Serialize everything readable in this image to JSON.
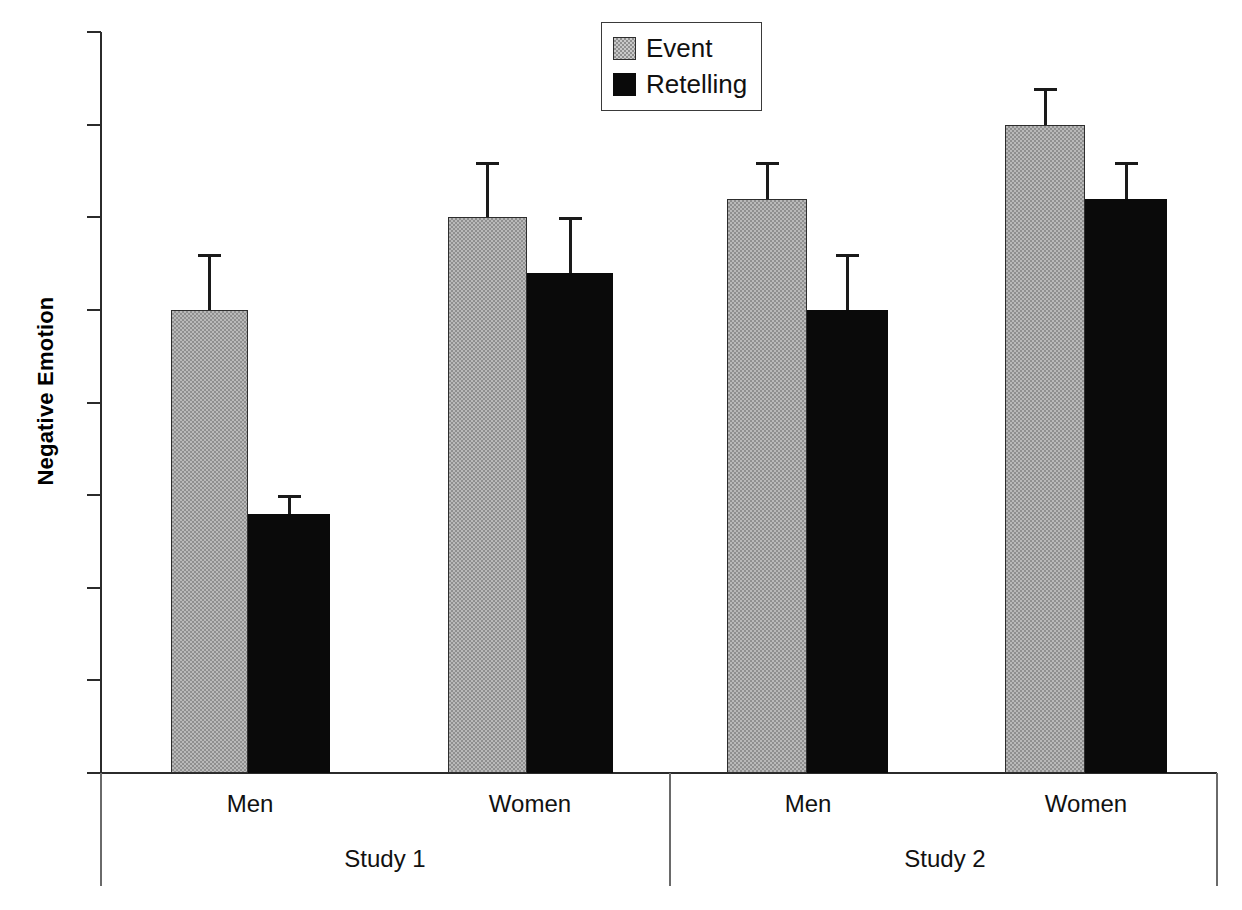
{
  "chart_data": {
    "type": "bar",
    "title": "",
    "xlabel": "",
    "ylabel": "Negative Emotion",
    "ylim": [
      0,
      4
    ],
    "ytick_labels": [
      "0",
      "0.5",
      "1",
      "1.5",
      "2",
      "2.5",
      "3",
      "3.5",
      "4"
    ],
    "ytick_values": [
      0,
      0.5,
      1,
      1.5,
      2,
      2.5,
      3,
      3.5,
      4
    ],
    "grid": false,
    "legend_position": "top-center",
    "legend": [
      "Event",
      "Retelling"
    ],
    "group_labels": [
      "Study 1",
      "Study 2"
    ],
    "categories": [
      "Men",
      "Women",
      "Men",
      "Women"
    ],
    "groups": [
      {
        "study": "Study 1",
        "categories": [
          {
            "label": "Men",
            "bars": [
              {
                "series": "Event",
                "value": 2.5,
                "error": 0.3
              },
              {
                "series": "Retelling",
                "value": 1.4,
                "error": 0.1
              }
            ]
          },
          {
            "label": "Women",
            "bars": [
              {
                "series": "Event",
                "value": 3.0,
                "error": 0.3
              },
              {
                "series": "Retelling",
                "value": 2.7,
                "error": 0.3
              }
            ]
          }
        ]
      },
      {
        "study": "Study 2",
        "categories": [
          {
            "label": "Men",
            "bars": [
              {
                "series": "Event",
                "value": 3.1,
                "error": 0.2
              },
              {
                "series": "Retelling",
                "value": 2.5,
                "error": 0.3
              }
            ]
          },
          {
            "label": "Women",
            "bars": [
              {
                "series": "Event",
                "value": 3.5,
                "error": 0.2
              },
              {
                "series": "Retelling",
                "value": 3.1,
                "error": 0.2
              }
            ]
          }
        ]
      }
    ],
    "series": [
      {
        "name": "Event",
        "values": [
          2.5,
          3.0,
          3.1,
          3.5
        ],
        "errors": [
          0.3,
          0.3,
          0.2,
          0.2
        ],
        "color": "#b9b9b9",
        "pattern": "checker"
      },
      {
        "name": "Retelling",
        "values": [
          1.4,
          2.7,
          2.5,
          3.1
        ],
        "errors": [
          0.1,
          0.3,
          0.3,
          0.2
        ],
        "color": "#0a0a0a",
        "pattern": "solid"
      }
    ]
  },
  "layout": {
    "bar_pixels": [
      {
        "series": "Event",
        "left": 171,
        "width": 77
      },
      {
        "series": "Retelling",
        "left": 248,
        "width": 82
      },
      {
        "series": "Event",
        "left": 448,
        "width": 79
      },
      {
        "series": "Retelling",
        "left": 527,
        "width": 86
      },
      {
        "series": "Event",
        "left": 727,
        "width": 80
      },
      {
        "series": "Retelling",
        "left": 807,
        "width": 81
      },
      {
        "series": "Event",
        "left": 1005,
        "width": 80
      },
      {
        "series": "Retelling",
        "left": 1085,
        "width": 82
      }
    ]
  }
}
